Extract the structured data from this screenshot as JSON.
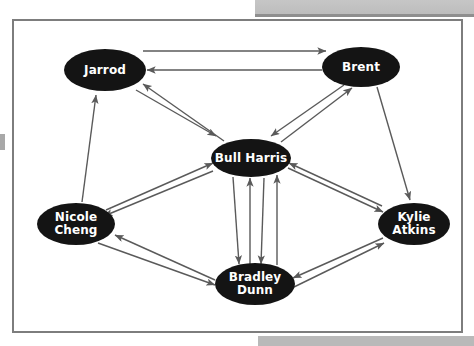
{
  "figure": {
    "background_color": "#ffffff",
    "frame_border_color": "#7d7d7d",
    "node_fill_color": "#141414",
    "node_text_color": "#ffffff",
    "edge_color": "#5a5a5a"
  },
  "nodes": [
    {
      "id": "jarrod",
      "label": "Jarrod",
      "cx": 105,
      "cy": 70,
      "rx": 41,
      "ry": 21,
      "font_size": 12
    },
    {
      "id": "brent",
      "label": "Brent",
      "cx": 361,
      "cy": 67,
      "rx": 39,
      "ry": 20,
      "font_size": 12
    },
    {
      "id": "bull-harris",
      "label": "Bull Harris",
      "cx": 251,
      "cy": 158,
      "rx": 40,
      "ry": 19,
      "font_size": 12
    },
    {
      "id": "nicole-cheng",
      "label": "Nicole\nCheng",
      "cx": 76,
      "cy": 224,
      "rx": 39,
      "ry": 21,
      "font_size": 12
    },
    {
      "id": "bradley-dunn",
      "label": "Bradley\nDunn",
      "cx": 255,
      "cy": 284,
      "rx": 40,
      "ry": 21,
      "font_size": 12
    },
    {
      "id": "kylie-atkins",
      "label": "Kylie\nAtkins",
      "cx": 414,
      "cy": 224,
      "rx": 36,
      "ry": 21,
      "font_size": 12
    }
  ],
  "edges": [
    {
      "id": "jarrod-brent-out",
      "from": "jarrod",
      "to": "brent",
      "x1": 143,
      "y1": 51,
      "x2": 326,
      "y2": 51,
      "arrow": "end"
    },
    {
      "id": "brent-jarrod-out",
      "from": "brent",
      "to": "jarrod",
      "x1": 322,
      "y1": 70,
      "x2": 147,
      "y2": 70,
      "arrow": "end"
    },
    {
      "id": "jarrod-bullharris-out",
      "from": "jarrod",
      "to": "bull-harris",
      "x1": 136,
      "y1": 90,
      "x2": 216,
      "y2": 136,
      "arrow": "end"
    },
    {
      "id": "bullharris-jarrod-out",
      "from": "bull-harris",
      "to": "jarrod",
      "x1": 224,
      "y1": 141,
      "x2": 143,
      "y2": 84,
      "arrow": "end"
    },
    {
      "id": "nicolecheng-jarrod-out",
      "from": "nicole-cheng",
      "to": "jarrod",
      "x1": 82,
      "y1": 202,
      "x2": 96,
      "y2": 95,
      "arrow": "end"
    },
    {
      "id": "brent-bullharris-out",
      "from": "brent",
      "to": "bull-harris",
      "x1": 344,
      "y1": 85,
      "x2": 271,
      "y2": 136,
      "arrow": "end"
    },
    {
      "id": "bullharris-brent-out",
      "from": "bull-harris",
      "to": "brent",
      "x1": 281,
      "y1": 142,
      "x2": 352,
      "y2": 88,
      "arrow": "end"
    },
    {
      "id": "brent-kylie-out",
      "from": "brent",
      "to": "kylie-atkins",
      "x1": 377,
      "y1": 87,
      "x2": 410,
      "y2": 200,
      "arrow": "end"
    },
    {
      "id": "nicolecheng-bull-out",
      "from": "nicole-cheng",
      "to": "bull-harris",
      "x1": 106,
      "y1": 210,
      "x2": 213,
      "y2": 163,
      "arrow": "end"
    },
    {
      "id": "bullharris-nicole-out",
      "from": "bull-harris",
      "to": "nicole-cheng",
      "x1": 213,
      "y1": 171,
      "x2": 104,
      "y2": 216,
      "arrow": "end"
    },
    {
      "id": "bullharris-kylie-out",
      "from": "bull-harris",
      "to": "kylie-atkins",
      "x1": 288,
      "y1": 168,
      "x2": 383,
      "y2": 212,
      "arrow": "end"
    },
    {
      "id": "kylie-bullharris-out",
      "from": "kylie-atkins",
      "to": "bull-harris",
      "x1": 382,
      "y1": 206,
      "x2": 289,
      "y2": 163,
      "arrow": "end"
    },
    {
      "id": "bullharris-bradley-a",
      "from": "bull-harris",
      "to": "bradley-dunn",
      "x1": 233,
      "y1": 177,
      "x2": 239,
      "y2": 264,
      "arrow": "end"
    },
    {
      "id": "bradley-bullharris-a",
      "from": "bradley-dunn",
      "to": "bull-harris",
      "x1": 250,
      "y1": 264,
      "x2": 250,
      "y2": 178,
      "arrow": "end"
    },
    {
      "id": "bullharris-bradley-b",
      "from": "bull-harris",
      "to": "bradley-dunn",
      "x1": 264,
      "y1": 178,
      "x2": 261,
      "y2": 264,
      "arrow": "end"
    },
    {
      "id": "bradley-bullharris-b",
      "from": "bradley-dunn",
      "to": "bull-harris",
      "x1": 277,
      "y1": 265,
      "x2": 277,
      "y2": 175,
      "arrow": "end"
    },
    {
      "id": "nicolecheng-bradley-out",
      "from": "nicole-cheng",
      "to": "bradley-dunn",
      "x1": 98,
      "y1": 243,
      "x2": 215,
      "y2": 285,
      "arrow": "end"
    },
    {
      "id": "bradley-nicolecheng-out",
      "from": "bradley-dunn",
      "to": "nicole-cheng",
      "x1": 215,
      "y1": 280,
      "x2": 115,
      "y2": 235,
      "arrow": "end"
    },
    {
      "id": "bradley-kylie-out",
      "from": "bradley-dunn",
      "to": "kylie-atkins",
      "x1": 294,
      "y1": 287,
      "x2": 384,
      "y2": 243,
      "arrow": "end"
    },
    {
      "id": "kylie-bradley-out",
      "from": "kylie-atkins",
      "to": "bradley-dunn",
      "x1": 383,
      "y1": 238,
      "x2": 293,
      "y2": 278,
      "arrow": "end"
    }
  ]
}
